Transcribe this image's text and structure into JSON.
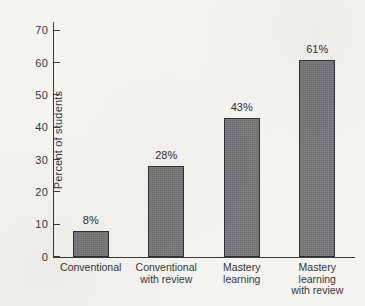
{
  "chart_data": {
    "type": "bar",
    "title": "",
    "subtitle": "",
    "xlabel": "",
    "ylabel": "Percent of students",
    "ylim": [
      0,
      73
    ],
    "yticks": [
      0,
      10,
      20,
      30,
      40,
      50,
      60,
      70
    ],
    "ytick_labels": [
      "0",
      "10",
      "20",
      "30",
      "40",
      "50",
      "60",
      "70"
    ],
    "grid": false,
    "legend": null,
    "categories": [
      "Conventional",
      "Conventional\nwith review",
      "Mastery\nlearning",
      "Mastery\nlearning\nwith review"
    ],
    "values": [
      8,
      28,
      43,
      61
    ],
    "data_labels": [
      "8%",
      "28%",
      "43%",
      "61%"
    ],
    "bar_color": "#77777a",
    "bar_edge_color": "#2f2f33",
    "background_color": "#f6f4f0",
    "axis_color": "#3b3b3b",
    "text_color": "#34343a"
  },
  "axis": {
    "y_title": "Percent of students",
    "ticks": [
      {
        "value": "70"
      },
      {
        "value": "60"
      },
      {
        "value": "50"
      },
      {
        "value": "40"
      },
      {
        "value": "30"
      },
      {
        "value": "20"
      },
      {
        "value": "10"
      },
      {
        "value": "0"
      }
    ]
  },
  "bars": [
    {
      "label": "Conventional",
      "value_label": "8%"
    },
    {
      "label": "Conventional\nwith review",
      "value_label": "28%"
    },
    {
      "label": "Mastery\nlearning",
      "value_label": "43%"
    },
    {
      "label": "Mastery\nlearning\nwith review",
      "value_label": "61%"
    }
  ]
}
